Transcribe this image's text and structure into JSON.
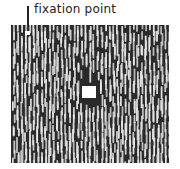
{
  "diagram": {
    "label": "fixation point",
    "colors": {
      "background": "#2a2a2a",
      "segments": "#e8e8e8",
      "target": "#ffffff",
      "annotation": "#222222"
    },
    "elements": {
      "fixation_point": {
        "x": 27,
        "y": 32
      },
      "center_square": {
        "x": 82,
        "y": 86,
        "width": 14,
        "height": 12
      }
    }
  }
}
